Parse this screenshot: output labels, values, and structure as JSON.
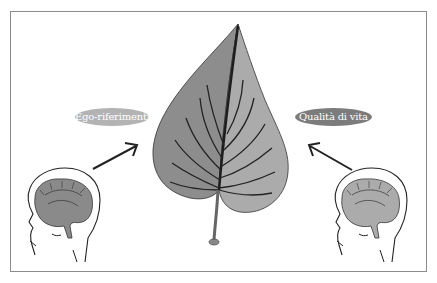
{
  "figure": {
    "labels": {
      "left": "Ego-riferimenti",
      "right": "Qualità di vita"
    },
    "colors": {
      "frame": "#8c8c8c",
      "pill_left": "#b3b3b3",
      "pill_right": "#7c7c7c",
      "leaf_left": "#8d8d8d",
      "leaf_right": "#ababab",
      "veins": "#2a2a2a",
      "brain_left": "#8a8a8a",
      "brain_right": "#ababab",
      "outline": "#222222"
    },
    "elements": [
      "head-left",
      "brain-left",
      "arrow-left",
      "leaf",
      "arrow-right",
      "head-right",
      "brain-right"
    ]
  }
}
